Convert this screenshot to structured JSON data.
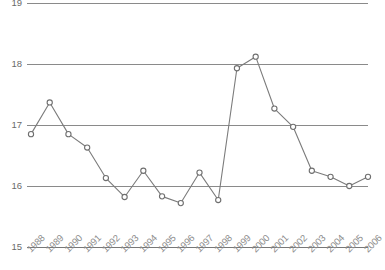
{
  "chart_data": {
    "type": "line",
    "title": "",
    "subtitle": "",
    "xlabel": "",
    "ylabel": "",
    "categories": [
      "1988",
      "1989",
      "1990",
      "1991",
      "1992",
      "1993",
      "1994",
      "1995",
      "1996",
      "1997",
      "1998",
      "1999",
      "2000",
      "2001",
      "2002",
      "2003",
      "2004",
      "2005",
      "2006"
    ],
    "values": [
      16.85,
      17.37,
      16.85,
      16.63,
      16.13,
      15.82,
      16.25,
      15.83,
      15.72,
      16.22,
      15.77,
      17.93,
      18.12,
      17.27,
      16.97,
      16.25,
      16.15,
      16.0,
      16.15
    ],
    "series": [
      {
        "name": "",
        "values": [
          16.85,
          17.37,
          16.85,
          16.63,
          16.13,
          15.82,
          16.25,
          15.83,
          15.72,
          16.22,
          15.77,
          17.93,
          18.12,
          17.27,
          16.97,
          16.25,
          16.15,
          16.0,
          16.15
        ]
      }
    ],
    "ylim": [
      15,
      19
    ],
    "yticks": [
      "19",
      "18",
      "17",
      "16",
      "15"
    ],
    "ytick_values": [
      19,
      18,
      17,
      16,
      15
    ],
    "xtick_labels": [
      "1988",
      "1989",
      "1990",
      "1991",
      "1992",
      "1993",
      "1994",
      "1995",
      "1996",
      "1997",
      "1998",
      "1999",
      "2000",
      "2001",
      "2002",
      "2003",
      "2004",
      "2005",
      "2006"
    ],
    "xtick_rotation": -45,
    "grid": true,
    "grid_axis": "y",
    "legend": false,
    "legend_position": "none",
    "marker": "open-circle",
    "line_color": "#7b7b7b",
    "grid_color": "#8a8a8a",
    "marker_fill": "#ffffff",
    "marker_stroke": "#6f6f6f",
    "background": "#ffffff",
    "annotations": []
  },
  "layout": {
    "plot_left": 31,
    "plot_right": 368,
    "plot_top": 3,
    "plot_bottom": 247,
    "width": 385,
    "height": 270
  }
}
